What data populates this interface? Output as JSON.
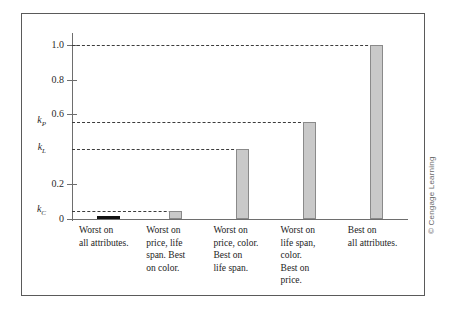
{
  "figure": {
    "copyright": "© Cengage Learning"
  },
  "chart_data": {
    "type": "bar",
    "title": "",
    "xlabel": "",
    "ylabel": "",
    "ylim": [
      0,
      1.05
    ],
    "grid": false,
    "legend": null,
    "orientation": "vertical",
    "bar_fill_color": "#c9c9c9",
    "bar_border_color": "#8a8a8a",
    "zero_bar_color": "#111111",
    "guide_line_color": "#3c3c3c",
    "axis_color": "#6e6e6e",
    "frame_color": "#5a5a5a",
    "categories": [
      "Worst on\nall attributes.",
      "Worst on\nprice, life\nspan. Best\non color.",
      "Worst on\nprice, color.\nBest on\nlife span.",
      "Worst on\nlife span,\ncolor.\nBest on\nprice.",
      "Best on\nall attributes."
    ],
    "values": [
      0.0,
      0.045,
      0.4,
      0.555,
      1.0
    ],
    "numeric_ticks": [
      {
        "value": 1.0,
        "label": "1.0"
      },
      {
        "value": 0.8,
        "label": "0.8"
      },
      {
        "value": 0.6,
        "label": "0.6"
      },
      {
        "value": 0.2,
        "label": "0.2"
      },
      {
        "value": 0.0,
        "label": "0"
      }
    ],
    "parameter_ticks": [
      {
        "value": 0.555,
        "symbol": "k",
        "subscript": "P",
        "label": "kP"
      },
      {
        "value": 0.4,
        "symbol": "k",
        "subscript": "L",
        "label": "kL"
      },
      {
        "value": 0.045,
        "symbol": "k",
        "subscript": "C",
        "label": "kC"
      }
    ],
    "guide_lines": [
      {
        "value": 1.0,
        "to_bar_index": 4
      },
      {
        "value": 0.555,
        "to_bar_index": 3
      },
      {
        "value": 0.4,
        "to_bar_index": 2
      },
      {
        "value": 0.045,
        "to_bar_index": 1
      }
    ]
  }
}
